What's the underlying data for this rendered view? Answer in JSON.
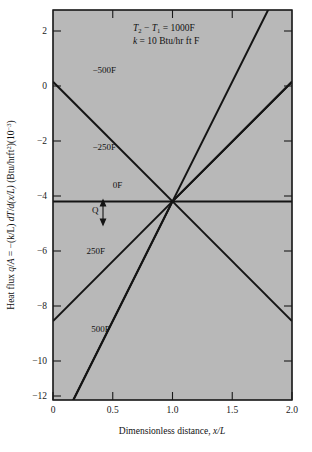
{
  "figure": {
    "background": "#ffffff",
    "plot_background": "#b8b8b8",
    "line_color": "#141414",
    "axis_color": "#1a1a1a"
  },
  "axes": {
    "x": {
      "title_prefix": "Dimensionless distance, ",
      "title_symbol": "x/L",
      "ticks": [
        "0",
        "0.5",
        "1.0",
        "1.5",
        "2.0"
      ],
      "tick_values": [
        0,
        0.5,
        1.0,
        1.5,
        2.0
      ],
      "range": [
        0,
        2.0
      ]
    },
    "y": {
      "title_part1": "Heat flux ",
      "title_q": "q",
      "title_a": "A",
      "title_eq": " = −(k/L) ",
      "title_dT": "dT",
      "title_dxL": "d(x/L)",
      "title_units_open": "(Btu/hrft",
      "title_units_sup": "2",
      "title_units_mid": ")(10",
      "title_units_exp": "−3",
      "title_units_close": ")",
      "ticks": [
        "2",
        "0",
        "−2",
        "−4",
        "−6",
        "−8",
        "−10",
        "−12"
      ],
      "tick_values": [
        2,
        0,
        -2,
        -4,
        -6,
        -8,
        -10,
        -12
      ],
      "range": [
        -13.3,
        3.0
      ]
    }
  },
  "annotations": {
    "line1_T2": "T",
    "line1_sub2": "2",
    "line1_minus": " − ",
    "line1_T1": "T",
    "line1_sub1": "1",
    "line1_rest": " = 1000F",
    "line2_k": "k",
    "line2_rest": " = 10 Btu/hr ft F",
    "q_label": "Q"
  },
  "chart_data": {
    "type": "line",
    "title": "",
    "xlabel": "Dimensionless distance, x/L",
    "ylabel": "Heat flux q/A = -(k/L) dT/d(x/L)  (Btu/hrft^2)(10^-3)",
    "xlim": [
      0,
      2.0
    ],
    "ylim": [
      -13.3,
      3.0
    ],
    "grid": false,
    "legend": "inline-labels",
    "annotations": [
      "T2 - T1 = 1000F",
      "k = 10 Btu/hr ft F",
      "Q"
    ],
    "converge_point": {
      "x": 1.0,
      "y": -5
    },
    "series": [
      {
        "name": "-500F",
        "label": "−500F",
        "label_pos": {
          "x": 0.33,
          "y": 0.35
        },
        "x": [
          0.0,
          1.0,
          2.0
        ],
        "y": [
          -15.0,
          -5.0,
          0.0
        ],
        "slope": 5.0
      },
      {
        "name": "-250F",
        "label": "−250F",
        "label_pos": {
          "x": 0.33,
          "y": -2.85
        },
        "x": [
          0.0,
          1.0,
          2.0
        ],
        "y": [
          0.0,
          -5.0,
          -10.0
        ],
        "slope": -5.0
      },
      {
        "name": "0F",
        "label": "0F",
        "label_pos": {
          "x": 0.5,
          "y": -4.45
        },
        "x": [
          0.0,
          1.0,
          2.0
        ],
        "y": [
          -5.0,
          -5.0,
          -5.0
        ],
        "slope": 0.0
      },
      {
        "name": "250F",
        "label": "250F",
        "label_pos": {
          "x": 0.28,
          "y": -7.2
        },
        "x": [
          0.0,
          1.0,
          2.0
        ],
        "y": [
          -10.0,
          -5.0,
          0.0
        ],
        "slope": 5.0
      },
      {
        "name": "500F",
        "label": "500F",
        "label_pos": {
          "x": 0.32,
          "y": -10.45
        },
        "x": [
          0.0,
          1.0,
          2.0
        ],
        "y": [
          -15.0,
          -5.0,
          5.0
        ],
        "slope": 10.0
      },
      {
        "name": "-500F-mirror",
        "label": "",
        "x": [
          0.0,
          1.0,
          2.0
        ],
        "y": [
          5.0,
          -5.0,
          -15.0
        ],
        "slope": -10.0
      }
    ]
  }
}
